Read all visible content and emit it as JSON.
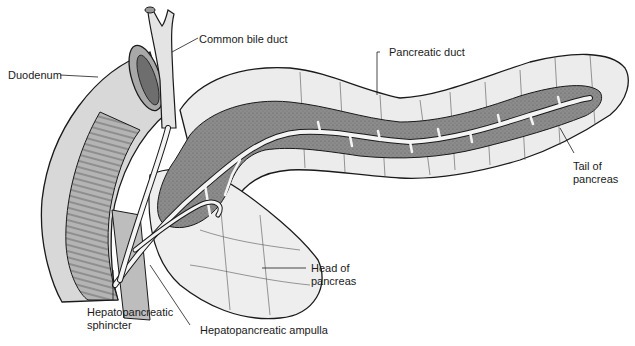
{
  "diagram": {
    "colors": {
      "line": "#1a1a1a",
      "parenchyma": "#ececec",
      "duct_tissue": "#8c8c8c",
      "duct_lumen": "#f4f4f4",
      "duodenum": "#d6d6d6",
      "duodenum_inner": "#a8a8a8",
      "background": "#ffffff"
    },
    "labels": {
      "duodenum": "Duodenum",
      "common_bile_duct": "Common bile duct",
      "pancreatic_duct": "Pancreatic duct",
      "tail_line1": "Tail of",
      "tail_line2": "pancreas",
      "head_line1": "Head of",
      "head_line2": "pancreas",
      "sphincter_line1": "Hepatopancreatic",
      "sphincter_line2": "sphincter",
      "ampulla": "Hepatopancreatic ampulla"
    }
  }
}
